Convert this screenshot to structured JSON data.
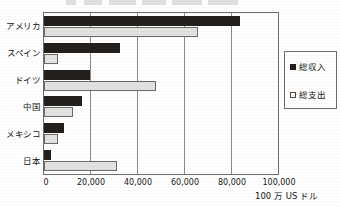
{
  "chart_data": {
    "type": "bar",
    "orientation": "horizontal",
    "title": "",
    "xlabel": "100 万 US ドル",
    "ylabel": "",
    "categories": [
      "アメリカ",
      "スペイン",
      "ドイツ",
      "中国",
      "メキシコ",
      "日本"
    ],
    "series": [
      {
        "name": "総収入",
        "color": "#231f1c",
        "marker": "filled-square",
        "values": [
          83500,
          32500,
          19500,
          16000,
          8500,
          3000
        ]
      },
      {
        "name": "総支出",
        "color": "#e2e2e0",
        "marker": "hollow-square",
        "values": [
          65500,
          6000,
          47500,
          12500,
          6000,
          31000
        ]
      }
    ],
    "xlim": [
      0,
      100000
    ],
    "xticks": [
      0,
      20000,
      40000,
      60000,
      80000,
      100000
    ],
    "xtick_labels": [
      "0",
      "20,000",
      "40,000",
      "60,000",
      "80,000",
      "100,000"
    ],
    "grid": "vertical",
    "legend_position": "right"
  },
  "legend": {
    "items": [
      {
        "label": "総収入"
      },
      {
        "label": "総支出"
      }
    ]
  },
  "axis": {
    "x_title": "100 万 US ドル"
  },
  "colors": {
    "income": "#231f1c",
    "expense": "#e2e2e0",
    "frame": "#6d6d6d",
    "grid": "#8a8a8a",
    "text": "#161616"
  }
}
